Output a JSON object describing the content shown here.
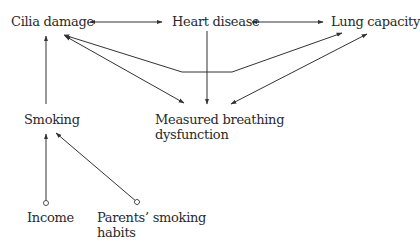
{
  "diagram": {
    "type": "causal-graph",
    "nodes": {
      "cilia_damage": {
        "label": "Cilia damage"
      },
      "heart_disease": {
        "label": "Heart disease"
      },
      "lung_capacity": {
        "label": "Lung capacity"
      },
      "smoking": {
        "label": "Smoking"
      },
      "breathing": {
        "line1": "Measured breathing",
        "line2": "dysfunction"
      },
      "income": {
        "label": "Income"
      },
      "parents": {
        "line1": "Parents’ smoking",
        "line2": "habits"
      }
    },
    "edges": [
      {
        "from": "Cilia damage",
        "to": "Heart disease",
        "style": "bidirected"
      },
      {
        "from": "Heart disease",
        "to": "Lung capacity",
        "style": "bidirected"
      },
      {
        "from": "Cilia damage",
        "to": "Lung capacity",
        "style": "bidirected",
        "routing": "polyline-below"
      },
      {
        "from": "Cilia damage",
        "to": "Measured breathing dysfunction",
        "style": "bidirected"
      },
      {
        "from": "Heart disease",
        "to": "Measured breathing dysfunction",
        "style": "directed"
      },
      {
        "from": "Lung capacity",
        "to": "Measured breathing dysfunction",
        "style": "bidirected"
      },
      {
        "from": "Smoking",
        "to": "Cilia damage",
        "style": "directed"
      },
      {
        "from": "Income",
        "to": "Smoking",
        "style": "circle-arrow"
      },
      {
        "from": "Parents’ smoking habits",
        "to": "Smoking",
        "style": "circle-arrow"
      }
    ],
    "colors": {
      "line": "#333333",
      "text": "#2a2a2a",
      "background": "#ffffff"
    }
  }
}
